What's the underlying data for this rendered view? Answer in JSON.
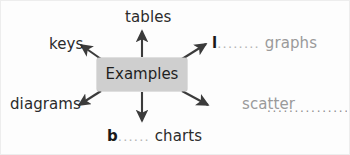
{
  "diagram": {
    "type": "concept-map",
    "center": {
      "label": "Examples",
      "fill_color": "#cfcfcf",
      "text_color": "#1f1f1f"
    },
    "branches": [
      {
        "id": "tables",
        "label": "tables",
        "direction": "up",
        "style": "filled-answer",
        "text_color": "#2b2b2b"
      },
      {
        "id": "keys",
        "label": "keys",
        "direction": "up-left",
        "style": "filled-answer",
        "text_color": "#2b2b2b"
      },
      {
        "id": "line-graphs",
        "prefix": "l",
        "dots": "........",
        "label": "graphs",
        "direction": "up-right",
        "style": "blank-with-prefix",
        "text_color": "#9a9a9a",
        "prefix_color": "#1a1a1a"
      },
      {
        "id": "diagrams",
        "label": "diagrams",
        "direction": "down-left",
        "style": "filled-answer",
        "text_color": "#2b2b2b"
      },
      {
        "id": "bar-charts",
        "prefix": "b",
        "dots": "......",
        "label": "charts",
        "direction": "down",
        "style": "blank-with-prefix",
        "text_color": "#2b2b2b",
        "prefix_color": "#1a1a1a"
      },
      {
        "id": "scatter",
        "label": "scatter",
        "dots": "................",
        "direction": "down-right",
        "style": "blank-trailing",
        "text_color": "#9a9a9a"
      }
    ],
    "arrow_color": "#3b3b3b",
    "background_color": "#fdfdfd"
  }
}
